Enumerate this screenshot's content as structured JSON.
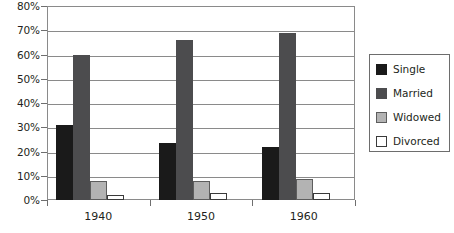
{
  "chart_data": {
    "type": "bar",
    "title": "",
    "subtitle": "",
    "xlabel": "",
    "ylabel": "",
    "categories": [
      "1940",
      "1950",
      "1960"
    ],
    "series": [
      {
        "name": "Single",
        "color": "#1a1a1a",
        "values": [
          31,
          23.5,
          22
        ]
      },
      {
        "name": "Married",
        "color": "#4c4c4e",
        "values": [
          60,
          66,
          69
        ]
      },
      {
        "name": "Widowed",
        "color": "#b3b3b3",
        "values": [
          8,
          8,
          8.5
        ]
      },
      {
        "name": "Divorced",
        "color": "#ffffff",
        "values": [
          2,
          3,
          3
        ]
      }
    ],
    "ylim": [
      0,
      80
    ],
    "ytick_step": 10,
    "ytick_labels": [
      "0%",
      "10%",
      "20%",
      "30%",
      "40%",
      "50%",
      "60%",
      "70%",
      "80%"
    ],
    "ytick_values": [
      0,
      10,
      20,
      30,
      40,
      50,
      60,
      70,
      80
    ],
    "grid": true,
    "grid_axis": "y",
    "legend_position": "right",
    "legend_entries": [
      "Single",
      "Married",
      "Widowed",
      "Divorced"
    ]
  }
}
